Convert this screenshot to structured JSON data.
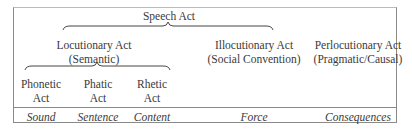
{
  "title": "Speech Act",
  "level1": [
    {
      "label": "Locutionary Act",
      "sub": "(Semantic)"
    },
    {
      "label": "Illocutionary Act",
      "sub": "(Social Convention)"
    },
    {
      "label": "Perlocutionary Act",
      "sub": "(Pragmatic/Causal)"
    }
  ],
  "level2": [
    {
      "label": "Phonetic",
      "sub": "Act"
    },
    {
      "label": "Phatic",
      "sub": "Act"
    },
    {
      "label": "Rhetic",
      "sub": "Act"
    }
  ],
  "bottom_row": [
    "Sound",
    "Sentence",
    "Content",
    "Force",
    "Consequences"
  ]
}
